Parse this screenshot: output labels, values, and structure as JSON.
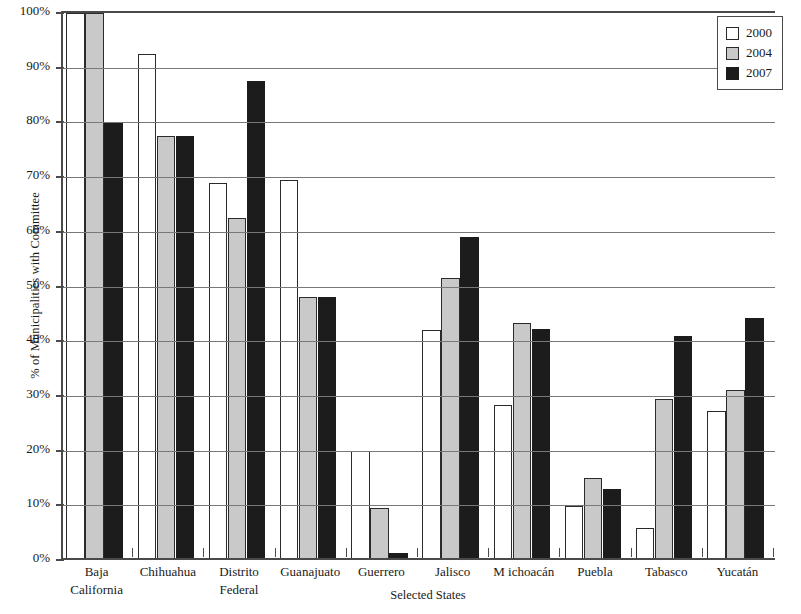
{
  "chart_data": {
    "type": "bar",
    "title": "",
    "subtitle": "",
    "xlabel": "Selected States",
    "ylabel": "% of Municipalities with Committee",
    "ylim": [
      0,
      100
    ],
    "y_unit": "%",
    "grid": true,
    "legend_position": "top-right",
    "categories": [
      "Baja California",
      "Chihuahua",
      "Distrito Federal",
      "Guanajuato",
      "Guerrero",
      "Jalisco",
      "Michoacán",
      "Puebla",
      "Tabasco",
      "Yucatán"
    ],
    "category_lines": [
      [
        "Baja",
        "California"
      ],
      [
        "Chihuahua"
      ],
      [
        "Distrito",
        "Federal"
      ],
      [
        "Guanajuato"
      ],
      [
        "Guerrero"
      ],
      [
        "Jalisco"
      ],
      [
        "M ichoacán"
      ],
      [
        "Puebla"
      ],
      [
        "Tabasco"
      ],
      [
        "Yucatán"
      ]
    ],
    "y_ticks": [
      "0%",
      "10%",
      "20%",
      "30%",
      "40%",
      "50%",
      "60%",
      "70%",
      "80%",
      "90%",
      "100%"
    ],
    "y_tick_values": [
      0,
      10,
      20,
      30,
      40,
      50,
      60,
      70,
      80,
      90,
      100
    ],
    "series": [
      {
        "name": "2000",
        "color": "#ffffff",
        "values": [
          100,
          92.5,
          69,
          69.5,
          20,
          42,
          28.3,
          9.8,
          5.8,
          27.3
        ]
      },
      {
        "name": "2004",
        "color": "#c9c9c9",
        "values": [
          100,
          77.5,
          62.5,
          48,
          9.5,
          51.5,
          43.3,
          15,
          29.5,
          31
        ]
      },
      {
        "name": "2007",
        "color": "#1c1c1c",
        "values": [
          80,
          77.5,
          87.5,
          48,
          1.3,
          59,
          42.3,
          13,
          41,
          44.2
        ]
      }
    ]
  }
}
